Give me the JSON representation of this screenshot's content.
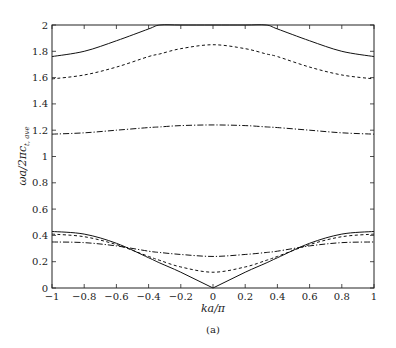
{
  "chart_data": {
    "type": "line",
    "title": "",
    "caption": "(a)",
    "xlabel": "ka/π",
    "ylabel": "ωa/2πc_{t,ave}",
    "xlim": [
      -1,
      1
    ],
    "ylim": [
      0,
      2
    ],
    "grid": false,
    "legend": null,
    "xticks": [
      "-1",
      "-0.8",
      "-0.6",
      "-0.4",
      "-0.2",
      "0",
      "0.2",
      "0.4",
      "0.6",
      "0.8",
      "1"
    ],
    "yticks": [
      "0",
      "0.2",
      "0.4",
      "0.6",
      "0.8",
      "1",
      "1.2",
      "1.4",
      "1.6",
      "1.8",
      "2"
    ],
    "x": [
      -1,
      -0.8,
      -0.6,
      -0.4,
      -0.33,
      -0.2,
      0,
      0.2,
      0.33,
      0.4,
      0.6,
      0.8,
      1
    ],
    "series": [
      {
        "name": "upper-solid",
        "style": "solid",
        "values": [
          1.76,
          1.8,
          1.88,
          1.97,
          2.0,
          2.0,
          2.0,
          2.0,
          2.0,
          1.97,
          1.88,
          1.8,
          1.76
        ]
      },
      {
        "name": "upper-dashed",
        "style": "dashed",
        "values": [
          1.59,
          1.62,
          1.68,
          1.76,
          1.78,
          1.82,
          1.85,
          1.82,
          1.78,
          1.76,
          1.68,
          1.62,
          1.59
        ]
      },
      {
        "name": "upper-dashdot",
        "style": "dashdot",
        "values": [
          1.17,
          1.18,
          1.2,
          1.22,
          1.225,
          1.235,
          1.24,
          1.235,
          1.225,
          1.22,
          1.2,
          1.18,
          1.17
        ]
      },
      {
        "name": "lower-solid",
        "style": "solid",
        "values": [
          0.43,
          0.41,
          0.34,
          0.23,
          0.19,
          0.12,
          0.0,
          0.12,
          0.19,
          0.23,
          0.34,
          0.41,
          0.43
        ]
      },
      {
        "name": "lower-dashed",
        "style": "dashed",
        "values": [
          0.41,
          0.39,
          0.33,
          0.24,
          0.21,
          0.16,
          0.12,
          0.16,
          0.21,
          0.24,
          0.33,
          0.39,
          0.41
        ]
      },
      {
        "name": "lower-dashdot",
        "style": "dashdot",
        "values": [
          0.35,
          0.345,
          0.32,
          0.28,
          0.27,
          0.255,
          0.24,
          0.255,
          0.27,
          0.28,
          0.32,
          0.345,
          0.35
        ]
      }
    ]
  },
  "labels": {
    "xlabel": "ka/π",
    "caption": "(a)"
  }
}
